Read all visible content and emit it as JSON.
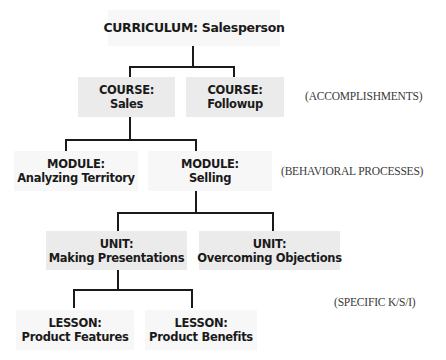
{
  "diagram": {
    "curriculum": {
      "type": "CURRICULUM:",
      "name": "Salesperson",
      "title": "CURRICULUM: Salesperson"
    },
    "courses": [
      {
        "type": "COURSE:",
        "name": "Sales"
      },
      {
        "type": "COURSE:",
        "name": "Followup"
      }
    ],
    "modules": [
      {
        "type": "MODULE:",
        "name": "Analyzing Territory"
      },
      {
        "type": "MODULE:",
        "name": "Selling"
      }
    ],
    "units": [
      {
        "type": "UNIT:",
        "name": "Making Presentations"
      },
      {
        "type": "UNIT:",
        "name": "Overcoming Objections"
      }
    ],
    "lessons": [
      {
        "type": "LESSON:",
        "name": "Product Features"
      },
      {
        "type": "LESSON:",
        "name": "Product Benefits"
      }
    ],
    "level_labels": {
      "courses": "(ACCOMPLISHMENTS)",
      "modules": "(BEHAVIORAL PROCESSES)",
      "lessons": "(SPECIFIC K/S/I)"
    },
    "colors": {
      "box_fill": "#ebebeb",
      "line": "#1a1a1a",
      "text": "#1a1a1a"
    }
  }
}
